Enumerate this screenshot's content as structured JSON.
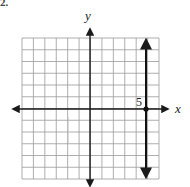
{
  "problem": {
    "label": "2."
  },
  "chart_data": {
    "type": "line",
    "title": "",
    "xlabel": "x",
    "ylabel": "y",
    "xlim": [
      -8,
      6
    ],
    "ylim": [
      -6,
      6
    ],
    "grid": true,
    "grid_cells": {
      "columns": 12,
      "rows": 12
    },
    "annotations": [
      {
        "text": "5",
        "x": 5,
        "y": 0,
        "position": "upper-left of point"
      }
    ],
    "series": [
      {
        "name": "vertical line x = 5",
        "kind": "vertical-line",
        "equation": "x = 5",
        "x": [
          5,
          5
        ],
        "y": [
          -6,
          6
        ],
        "arrows": "both",
        "marked_point": {
          "x": 5,
          "y": 0
        }
      }
    ]
  },
  "colors": {
    "grid": "#9a9a9a",
    "axis": "#1a1a1a",
    "line": "#111111"
  }
}
